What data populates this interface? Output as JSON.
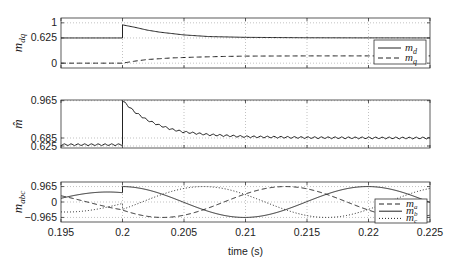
{
  "chart_data": [
    {
      "type": "line",
      "title": "",
      "ylabel": "m_dq",
      "ylabel_main": "m",
      "ylabel_sub": "dq",
      "xlim": [
        0.195,
        0.225
      ],
      "ylim": [
        -0.12,
        1.12
      ],
      "yticks": [
        0,
        0.625,
        1
      ],
      "ytick_labels": [
        "0",
        "0.625",
        "1"
      ],
      "grid": true,
      "legend": "right",
      "series": [
        {
          "name": "m_d",
          "label_main": "m",
          "label_sub": "d",
          "style": "solid",
          "description": "0.625 until t=0.2, step to ~0.95 then exponential decay back to ~0.625",
          "x": [
            0.195,
            0.2,
            0.2,
            0.201,
            0.202,
            0.203,
            0.205,
            0.207,
            0.21,
            0.215,
            0.22,
            0.225
          ],
          "y": [
            0.625,
            0.625,
            0.95,
            0.89,
            0.82,
            0.77,
            0.7,
            0.66,
            0.64,
            0.63,
            0.627,
            0.625
          ]
        },
        {
          "name": "m_q",
          "label_main": "m",
          "label_sub": "q",
          "style": "dashed",
          "description": "0 until t=0.2, then rises to ~0.18",
          "x": [
            0.195,
            0.2,
            0.201,
            0.202,
            0.204,
            0.206,
            0.208,
            0.21,
            0.215,
            0.22,
            0.225
          ],
          "y": [
            0,
            0,
            0.05,
            0.09,
            0.13,
            0.15,
            0.165,
            0.175,
            0.18,
            0.18,
            0.18
          ]
        }
      ]
    },
    {
      "type": "line",
      "title": "",
      "ylabel": "m_hat",
      "ylabel_main": "m̂",
      "xlim": [
        0.195,
        0.225
      ],
      "ylim": [
        0.61,
        0.97
      ],
      "yticks": [
        0.625,
        0.685,
        0.965
      ],
      "ytick_labels": [
        "0.625",
        "0.685",
        "0.965"
      ],
      "grid": true,
      "series": [
        {
          "name": "m_hat",
          "style": "solid",
          "ripple": true,
          "description": "~0.635 with ripple until t=0.2, step to 0.965 then decays to ~0.68 with ripple",
          "x": [
            0.195,
            0.2,
            0.2,
            0.201,
            0.202,
            0.203,
            0.204,
            0.205,
            0.207,
            0.21,
            0.215,
            0.22,
            0.225
          ],
          "y": [
            0.635,
            0.635,
            0.965,
            0.88,
            0.82,
            0.78,
            0.75,
            0.73,
            0.71,
            0.695,
            0.688,
            0.686,
            0.685
          ]
        }
      ]
    },
    {
      "type": "line",
      "title": "",
      "ylabel": "m_abc",
      "ylabel_main": "m",
      "ylabel_sub": "abc",
      "xlabel": "time (s)",
      "xlim": [
        0.195,
        0.225
      ],
      "ylim": [
        -1.25,
        1.25
      ],
      "xticks": [
        0.195,
        0.2,
        0.205,
        0.21,
        0.215,
        0.22,
        0.225
      ],
      "xtick_labels": [
        "0.195",
        "0.2",
        "0.205",
        "0.21",
        "0.215",
        "0.22",
        "0.225"
      ],
      "yticks": [
        -0.965,
        0,
        0.965
      ],
      "ytick_labels": [
        "-0.965",
        "0",
        "0.965"
      ],
      "grid": true,
      "legend": "bottom-right",
      "series": [
        {
          "name": "m_a",
          "label_main": "m",
          "label_sub": "a",
          "style": "dashed",
          "description": "three-phase sinusoid, 50 Hz; amplitude ~0.625 before t=0.2, ~0.965 after"
        },
        {
          "name": "m_b",
          "label_main": "m",
          "label_sub": "b",
          "style": "solid",
          "description": "three-phase sinusoid, 50 Hz; amplitude ~0.625 before t=0.2, ~0.965 after"
        },
        {
          "name": "m_c",
          "label_main": "m",
          "label_sub": "c",
          "style": "dotted",
          "description": "three-phase sinusoid, 50 Hz; amplitude ~0.625 before t=0.2, ~0.965 after"
        }
      ],
      "waveform": {
        "frequency_hz": 50,
        "amp_before": 0.625,
        "amp_after": 0.965,
        "step_time": 0.2
      }
    }
  ]
}
